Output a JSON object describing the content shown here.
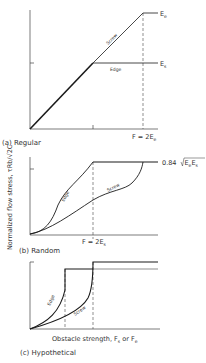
{
  "figure": {
    "y_axis_label": "Normalized flow stress, τRb/√2C",
    "x_axis_label": "Obstacle strength, F",
    "x_axis_label_sub_s": "s",
    "x_axis_label_or": " or F",
    "x_axis_label_sub_e": "e"
  },
  "panels": [
    {
      "caption": "(a) Regular",
      "curves": [
        {
          "name": "Screw",
          "label": "Screw"
        },
        {
          "name": "Edge",
          "label": "Edge"
        }
      ],
      "level_labels": [
        {
          "main": "E",
          "sub": "e"
        },
        {
          "main": "E",
          "sub": "s"
        }
      ],
      "x_marker": {
        "main": "F = 2E",
        "sub": "e"
      }
    },
    {
      "caption": "(b) Random",
      "curves": [
        {
          "name": "Edge",
          "label": "Edge"
        },
        {
          "name": "Screw",
          "label": "Screw"
        }
      ],
      "level_label": {
        "prefix": "0.84 ",
        "radicand_main1": "E",
        "radicand_sub1": "e",
        "radicand_main2": "E",
        "radicand_sub2": "s"
      },
      "x_marker": {
        "main": "F = 2E",
        "sub": "s"
      }
    },
    {
      "caption": "(c) Hypothetical",
      "curves": [
        {
          "name": "Edge",
          "label": "Edge"
        },
        {
          "name": "Screw",
          "label": "Screw"
        }
      ]
    }
  ],
  "colors": {
    "line": "#1a1a1a",
    "text": "#333333",
    "background": "#ffffff"
  }
}
